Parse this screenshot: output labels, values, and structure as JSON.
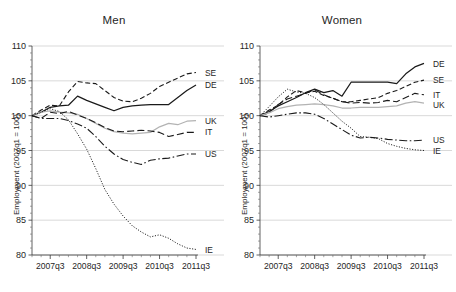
{
  "figure": {
    "width": 456,
    "height": 292,
    "background": "#ffffff"
  },
  "chart_data": {
    "type": "line",
    "title": "",
    "xlabel": "",
    "ylabel": "Employment (2007q1 = 100)",
    "ylim": [
      80,
      110
    ],
    "yticks": [
      80,
      85,
      90,
      95,
      100,
      105,
      110
    ],
    "ytick_labels": [
      "80",
      "85",
      "90",
      "95",
      "100",
      "105",
      "110"
    ],
    "grid": true,
    "grid_axis": "y",
    "legend_position": "right-of-line-ends",
    "x": [
      "2007q1",
      "2007q2",
      "2007q3",
      "2007q4",
      "2008q1",
      "2008q2",
      "2008q3",
      "2008q4",
      "2009q1",
      "2009q2",
      "2009q3",
      "2009q4",
      "2010q1",
      "2010q2",
      "2010q3",
      "2010q4",
      "2011q1",
      "2011q2",
      "2011q3"
    ],
    "xticks": [
      "2007q3",
      "2008q3",
      "2009q3",
      "2010q3",
      "2011q3"
    ],
    "xtick_indices": [
      2,
      6,
      10,
      14,
      18
    ],
    "panels": [
      {
        "name": "men",
        "title": "Men",
        "series": [
          {
            "name": "SE",
            "label": "SE",
            "style": "dashed",
            "color": "#1a1a1a",
            "values": [
              100.0,
              100.8,
              101.5,
              101.4,
              103.4,
              104.9,
              104.7,
              104.6,
              103.6,
              102.6,
              102.1,
              102.0,
              102.5,
              103.2,
              104.2,
              104.8,
              105.4,
              106.0,
              106.2
            ]
          },
          {
            "name": "DE",
            "label": "DE",
            "style": "solid",
            "color": "#1a1a1a",
            "values": [
              100.0,
              100.5,
              101.2,
              101.4,
              101.5,
              102.8,
              102.2,
              101.7,
              101.2,
              100.7,
              101.2,
              101.4,
              101.5,
              101.6,
              101.6,
              101.6,
              102.6,
              103.6,
              104.4
            ]
          },
          {
            "name": "UK",
            "label": "UK",
            "style": "solid",
            "color": "#b3b3b3",
            "values": [
              100.0,
              100.5,
              100.7,
              100.5,
              100.4,
              100.2,
              99.6,
              98.9,
              98.2,
              97.7,
              97.5,
              97.4,
              97.5,
              97.6,
              98.4,
              98.9,
              98.7,
              99.2,
              99.3
            ]
          },
          {
            "name": "IT",
            "label": "IT",
            "style": "longdash",
            "color": "#1a1a1a",
            "values": [
              100.0,
              99.6,
              100.5,
              100.3,
              100.6,
              100.1,
              99.6,
              99.0,
              98.3,
              97.8,
              97.7,
              97.8,
              97.9,
              97.8,
              97.6,
              97.0,
              97.3,
              97.6,
              97.6
            ]
          },
          {
            "name": "US",
            "label": "US",
            "style": "dashdot",
            "color": "#1a1a1a",
            "values": [
              100.0,
              99.6,
              99.6,
              99.6,
              99.3,
              98.8,
              98.2,
              97.0,
              95.6,
              94.5,
              93.7,
              93.3,
              93.0,
              93.6,
              93.8,
              93.9,
              94.2,
              94.5,
              94.5
            ]
          },
          {
            "name": "IE",
            "label": "IE",
            "style": "dotted",
            "color": "#1a1a1a",
            "values": [
              100.0,
              100.5,
              101.0,
              100.6,
              99.4,
              97.4,
              95.2,
              92.4,
              89.4,
              87.3,
              85.6,
              84.2,
              83.3,
              82.6,
              82.9,
              82.4,
              81.6,
              81.0,
              80.8
            ]
          }
        ]
      },
      {
        "name": "women",
        "title": "Women",
        "series": [
          {
            "name": "DE",
            "label": "DE",
            "style": "solid",
            "color": "#1a1a1a",
            "values": [
              100.0,
              100.6,
              101.4,
              102.0,
              102.6,
              103.3,
              103.8,
              103.3,
              103.6,
              102.8,
              104.8,
              104.8,
              104.8,
              104.8,
              104.8,
              104.6,
              106.0,
              107.0,
              107.5
            ]
          },
          {
            "name": "SE",
            "label": "SE",
            "style": "dashed",
            "color": "#1a1a1a",
            "values": [
              100.0,
              100.8,
              101.5,
              102.7,
              103.6,
              103.3,
              103.5,
              102.9,
              102.5,
              102.0,
              102.0,
              102.2,
              102.4,
              102.6,
              103.2,
              103.6,
              104.2,
              104.8,
              105.1
            ]
          },
          {
            "name": "IT",
            "label": "IT",
            "style": "longdash",
            "color": "#1a1a1a",
            "values": [
              100.0,
              100.4,
              101.6,
              102.4,
              102.8,
              103.2,
              103.7,
              103.0,
              102.5,
              102.0,
              101.8,
              101.9,
              101.8,
              101.9,
              102.2,
              102.0,
              102.6,
              103.2,
              103.0
            ]
          },
          {
            "name": "UK",
            "label": "UK",
            "style": "solid",
            "color": "#b3b3b3",
            "values": [
              100.0,
              100.4,
              101.0,
              101.3,
              101.5,
              101.6,
              101.7,
              101.6,
              101.4,
              101.1,
              101.1,
              101.2,
              101.2,
              101.2,
              101.3,
              101.4,
              101.8,
              102.0,
              101.8
            ]
          },
          {
            "name": "US",
            "label": "US",
            "style": "dashdot",
            "color": "#1a1a1a",
            "values": [
              100.0,
              99.8,
              100.0,
              100.2,
              100.4,
              100.4,
              100.2,
              99.6,
              98.8,
              98.0,
              97.2,
              96.8,
              96.9,
              96.8,
              96.6,
              96.5,
              96.4,
              96.4,
              96.5
            ]
          },
          {
            "name": "IE",
            "label": "IE",
            "style": "dotted",
            "color": "#1a1a1a",
            "values": [
              100.0,
              101.3,
              102.7,
              103.8,
              103.4,
              103.2,
              102.6,
              101.6,
              100.4,
              99.2,
              98.2,
              97.0,
              96.9,
              96.7,
              96.0,
              95.6,
              95.3,
              95.1,
              95.0
            ]
          }
        ]
      }
    ]
  }
}
